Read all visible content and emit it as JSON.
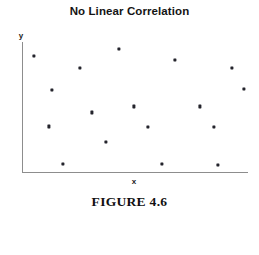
{
  "figure": {
    "title": "No Linear Correlation",
    "caption": "FIGURE 4.6",
    "background_color": "#ffffff",
    "axis_color": "#8d8d8d",
    "marker_color": "#24242c"
  },
  "axes": {
    "x_label": "x",
    "y_label": "y"
  },
  "chart_data": {
    "type": "scatter",
    "title": "No Linear Correlation",
    "subtitle": "FIGURE 4.6",
    "xlabel": "x",
    "ylabel": "y",
    "grid": false,
    "legend": null,
    "axis_ticks": false,
    "xlim": [
      0,
      100
    ],
    "ylim": [
      0,
      100
    ],
    "n_points": 17,
    "annotation": "No Linear Correlation",
    "points": [
      {
        "x": 5.3,
        "y": 89.3
      },
      {
        "x": 25.7,
        "y": 80.2
      },
      {
        "x": 42.9,
        "y": 94.7
      },
      {
        "x": 67.7,
        "y": 86.3
      },
      {
        "x": 92.9,
        "y": 80.2
      },
      {
        "x": 98.2,
        "y": 64.1
      },
      {
        "x": 11.9,
        "y": 35.1
      },
      {
        "x": 30.9,
        "y": 45.8
      },
      {
        "x": 49.6,
        "y": 50.4
      },
      {
        "x": 78.8,
        "y": 50.4
      },
      {
        "x": 55.8,
        "y": 34.4
      },
      {
        "x": 85.0,
        "y": 34.4
      },
      {
        "x": 37.2,
        "y": 22.9
      },
      {
        "x": 18.1,
        "y": 6.1
      },
      {
        "x": 61.9,
        "y": 6.1
      },
      {
        "x": 86.7,
        "y": 5.3
      },
      {
        "x": 13.3,
        "y": 63.4
      }
    ]
  }
}
